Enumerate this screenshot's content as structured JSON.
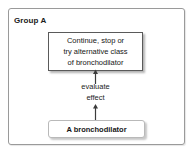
{
  "diagram": {
    "group_label": "Group A",
    "top_box": {
      "lines": [
        "Continue, stop or",
        "try alternative class",
        "of bronchodilator"
      ]
    },
    "arrow_label": {
      "lines": [
        "evaluate",
        "effect"
      ]
    },
    "bottom_box": {
      "lines": [
        "A bronchodilator"
      ]
    },
    "colors": {
      "background": "#ffffff",
      "frame_border": "#9a9a9a",
      "top_box_border": "#5a5a5a",
      "bottom_box_border": "#b9b9b9",
      "text": "#161616",
      "arrow": "#3c3c3c"
    }
  }
}
